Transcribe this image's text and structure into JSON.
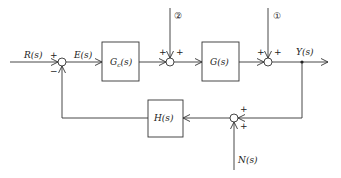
{
  "diagram": {
    "type": "feedback-control-block-diagram",
    "signals": {
      "input": "R(s)",
      "error": "E(s)",
      "output": "Y(s)",
      "noise": "N(s)"
    },
    "blocks": {
      "controller": "Gc(s)",
      "controller_main": "G",
      "controller_sub": "c",
      "controller_arg": "(s)",
      "plant": "G(s)",
      "feedback": "H(s)"
    },
    "disturbances": {
      "d1": "①",
      "d2": "②"
    },
    "signs": {
      "sum1_input": "+",
      "sum1_feedback": "−",
      "sum2_left": "+",
      "sum2_top": "+",
      "sum3_left": "+",
      "sum3_top": "+",
      "sum4_right": "+",
      "sum4_bottom": "+"
    },
    "colors": {
      "line": "#333333",
      "background": "#ffffff"
    }
  }
}
